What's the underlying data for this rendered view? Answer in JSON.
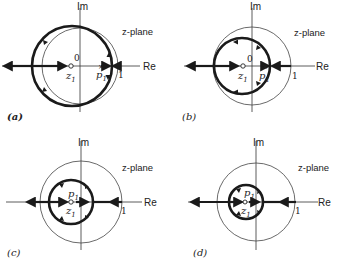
{
  "figure": {
    "panels": [
      {
        "id": "a",
        "caption": "(a)",
        "plane_label": "z-plane",
        "axes": {
          "real": "Re",
          "imag": "Im"
        },
        "origin_label": "0",
        "unit_label": "1",
        "zero_label": "z",
        "zero_sub": "1",
        "pole_label": "p",
        "pole_sub": "1",
        "description": "Root locus: large circle passing around zero z1 and pole p1 near unit circle; locus extends left to -infinity"
      },
      {
        "id": "b",
        "caption": "(b)",
        "plane_label": "z-plane",
        "axes": {
          "real": "Re",
          "imag": "Im"
        },
        "origin_label": "0",
        "unit_label": "1",
        "zero_label": "z",
        "zero_sub": "1",
        "pole_label": "p",
        "pole_sub": "1",
        "description": "Root locus circle fully inside unit circle"
      },
      {
        "id": "c",
        "caption": "(c)",
        "plane_label": "z-plane",
        "axes": {
          "real": "Re",
          "imag": "Im"
        },
        "unit_label": "1",
        "zero_label": "z",
        "zero_sub": "1",
        "pole_label": "p",
        "pole_sub": "1",
        "description": "Smaller root locus circle; pole and zero close together near origin"
      },
      {
        "id": "d",
        "caption": "(d)",
        "plane_label": "z-plane",
        "axes": {
          "real": "Re",
          "imag": "Im"
        },
        "unit_label": "1",
        "zero_label": "z",
        "zero_sub": "1",
        "pole_label": "p",
        "pole_sub": "1",
        "description": "Smallest root locus circle; pole and zero nearly coincident"
      }
    ]
  }
}
